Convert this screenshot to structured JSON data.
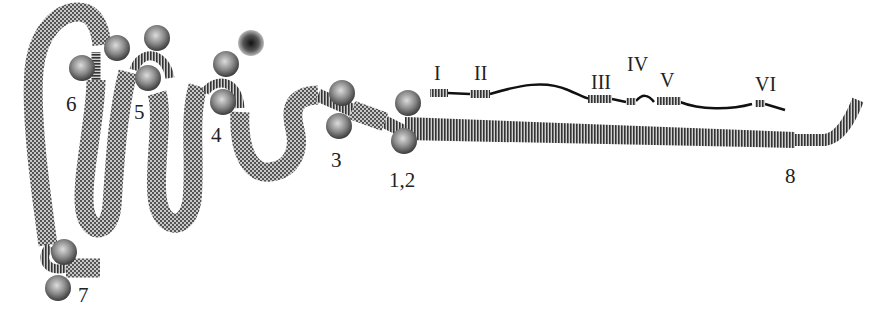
{
  "figure": {
    "type": "protein domain diagram",
    "colors": {
      "coil": "#8a8a8a",
      "helix": "#6e6e6e",
      "ball": "#7d7d7d",
      "dark_ball": "#3a3a3a",
      "line": "#111111",
      "text": "#222222"
    },
    "site_labels": [
      {
        "id": "6",
        "text": "6"
      },
      {
        "id": "5",
        "text": "5"
      },
      {
        "id": "4",
        "text": "4"
      },
      {
        "id": "3",
        "text": "3"
      },
      {
        "id": "1_2",
        "text": "1,2"
      },
      {
        "id": "7",
        "text": "7"
      },
      {
        "id": "8",
        "text": "8"
      }
    ],
    "segment_labels": [
      {
        "id": "I",
        "text": "I"
      },
      {
        "id": "II",
        "text": "II"
      },
      {
        "id": "III",
        "text": "III"
      },
      {
        "id": "IV",
        "text": "IV"
      },
      {
        "id": "V",
        "text": "V"
      },
      {
        "id": "VI",
        "text": "VI"
      }
    ]
  }
}
